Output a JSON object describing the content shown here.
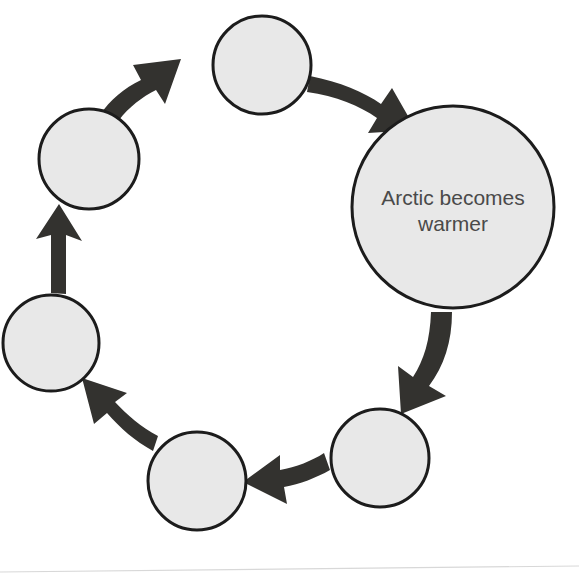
{
  "diagram": {
    "type": "cycle-diagram",
    "direction": "clockwise",
    "colors": {
      "node_fill": "#e8e8e8",
      "node_stroke": "#1c1c1c",
      "arrow_fill": "#33322f",
      "label_text": "#4a4a4a",
      "background": "#ffffff"
    },
    "nodes": [
      {
        "id": "node-arctic-warmer",
        "label_line_1": "Arctic becomes",
        "label_line_2": "warmer",
        "filled": true,
        "size": "large"
      },
      {
        "id": "node-blank-1",
        "label_line_1": "",
        "label_line_2": "",
        "filled": false,
        "size": "small"
      },
      {
        "id": "node-blank-2",
        "label_line_1": "",
        "label_line_2": "",
        "filled": false,
        "size": "small"
      },
      {
        "id": "node-blank-3",
        "label_line_1": "",
        "label_line_2": "",
        "filled": false,
        "size": "small"
      },
      {
        "id": "node-blank-4",
        "label_line_1": "",
        "label_line_2": "",
        "filled": false,
        "size": "small"
      },
      {
        "id": "node-blank-5",
        "label_line_1": "",
        "label_line_2": "",
        "filled": false,
        "size": "small"
      }
    ],
    "arrows": [
      {
        "id": "arrow-top-to-arctic",
        "from": "node-blank-5",
        "to": "node-arctic-warmer"
      },
      {
        "id": "arrow-arctic-to-br",
        "from": "node-arctic-warmer",
        "to": "node-blank-1"
      },
      {
        "id": "arrow-br-to-bl",
        "from": "node-blank-1",
        "to": "node-blank-2"
      },
      {
        "id": "arrow-bl-to-left",
        "from": "node-blank-2",
        "to": "node-blank-3"
      },
      {
        "id": "arrow-left-to-topleft",
        "from": "node-blank-3",
        "to": "node-blank-4"
      },
      {
        "id": "arrow-topleft-to-top",
        "from": "node-blank-4",
        "to": "node-blank-5"
      }
    ]
  }
}
